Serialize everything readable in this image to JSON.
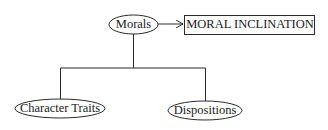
{
  "diagram": {
    "type": "hierarchy",
    "nodes": {
      "root": {
        "label": "Morals",
        "shape": "ellipse"
      },
      "output": {
        "label": "MORAL INCLINATION",
        "shape": "rectangle"
      },
      "child_left": {
        "label": "Character Traits",
        "shape": "ellipse"
      },
      "child_right": {
        "label": "Dispositions",
        "shape": "ellipse"
      }
    },
    "edges": [
      {
        "from": "Morals",
        "to": "MORAL INCLINATION",
        "type": "arrow"
      },
      {
        "from": "Morals",
        "to": "Character Traits",
        "type": "line"
      },
      {
        "from": "Morals",
        "to": "Dispositions",
        "type": "line"
      }
    ],
    "colors": {
      "stroke": "#2a2a2a",
      "text": "#1a1a1a",
      "background": "#ffffff"
    }
  }
}
